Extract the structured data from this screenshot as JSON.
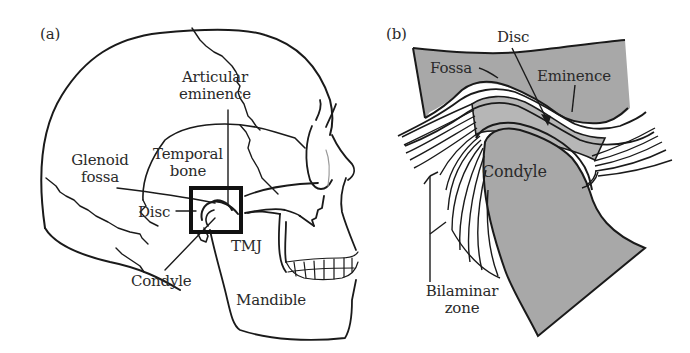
{
  "figure": {
    "colors": {
      "stroke": "#1a1a1a",
      "text": "#2a2a2a",
      "bone_gray": "#a8a8a8",
      "disc_gray": "#b6b6b6",
      "background": "#ffffff"
    },
    "panel_a": {
      "tag": "(a)",
      "title": "Lateral view of skull",
      "labels": {
        "articular_eminence_line1": "Articular",
        "articular_eminence_line2": "eminence",
        "glenoid_fossa_line1": "Glenoid",
        "glenoid_fossa_line2": "fossa",
        "temporal_bone_line1": "Temporal",
        "temporal_bone_line2": "bone",
        "disc": "Disc",
        "tmj": "TMJ",
        "condyle": "Condyle",
        "mandible": "Mandible"
      }
    },
    "panel_b": {
      "tag": "(b)",
      "title": "Close-up of temporomandibular joint",
      "labels": {
        "disc": "Disc",
        "fossa": "Fossa",
        "eminence": "Eminence",
        "condyle": "Condyle",
        "bilaminar_zone_line1": "Bilaminar",
        "bilaminar_zone_line2": "zone"
      }
    }
  }
}
